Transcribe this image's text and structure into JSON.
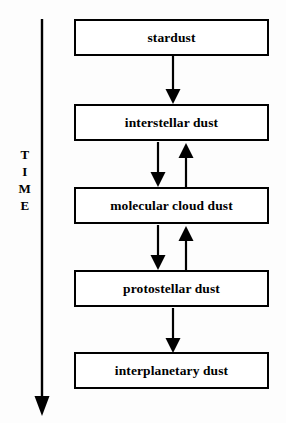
{
  "diagram": {
    "orientation": "vertical",
    "background_color": "#fdfdfd",
    "stroke_color": "#000000",
    "axis": {
      "label_letters": [
        "T",
        "I",
        "M",
        "E"
      ],
      "label_text": "TIME",
      "direction": "downward",
      "arrow_name": "time-arrow"
    },
    "nodes": [
      {
        "id": "stardust",
        "label": "stardust"
      },
      {
        "id": "interstellar-dust",
        "label": "interstellar dust"
      },
      {
        "id": "molecular-cloud-dust",
        "label": "molecular cloud dust"
      },
      {
        "id": "protostellar-dust",
        "label": "protostellar dust"
      },
      {
        "id": "interplanetary-dust",
        "label": "interplanetary dust"
      }
    ],
    "edges": [
      {
        "from": "stardust",
        "to": "interstellar-dust",
        "direction": "down"
      },
      {
        "from": "interstellar-dust",
        "to": "molecular-cloud-dust",
        "direction": "down"
      },
      {
        "from": "molecular-cloud-dust",
        "to": "interstellar-dust",
        "direction": "up"
      },
      {
        "from": "molecular-cloud-dust",
        "to": "protostellar-dust",
        "direction": "down"
      },
      {
        "from": "protostellar-dust",
        "to": "molecular-cloud-dust",
        "direction": "up"
      },
      {
        "from": "protostellar-dust",
        "to": "interplanetary-dust",
        "direction": "down"
      }
    ]
  }
}
